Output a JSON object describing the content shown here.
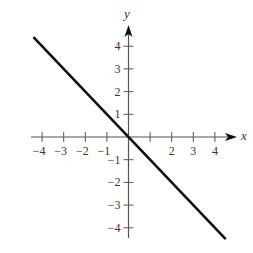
{
  "chart_data": {
    "type": "line",
    "title": "",
    "xlabel": "x",
    "ylabel": "y",
    "xlim": [
      -4.5,
      5
    ],
    "ylim": [
      -4.5,
      5
    ],
    "grid": false,
    "x_ticks": [
      -4,
      -3,
      -2,
      -1,
      1,
      2,
      3,
      4
    ],
    "x_tick_labels": [
      "−4",
      "−3",
      "−2",
      "−1",
      "",
      "2",
      "3",
      "4"
    ],
    "y_ticks": [
      4,
      3,
      2,
      1,
      -1,
      -2,
      -3,
      -4
    ],
    "y_tick_labels": [
      "4",
      "3",
      "2",
      "1",
      "−1",
      "−2",
      "−3",
      "−4"
    ],
    "series": [
      {
        "name": "y = -x",
        "x": [
          -4.4,
          4.5
        ],
        "y": [
          4.4,
          -4.5
        ],
        "color": "#111111"
      }
    ]
  },
  "layout": {
    "origin_px": [
      128.5,
      137
    ],
    "x_unit_px": 21.6,
    "y_unit_px": 22.7,
    "x_axis_px": [
      31,
      237
    ],
    "y_axis_px": [
      238,
      25
    ]
  },
  "colors": {
    "axis": "#555555",
    "line": "#111111",
    "text": "#333333"
  }
}
